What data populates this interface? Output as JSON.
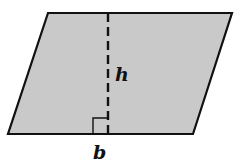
{
  "figure": {
    "shape": "parallelogram",
    "fill_color": "#c9c9c9",
    "stroke_color": "#111111",
    "vertices": {
      "top_left": [
        48,
        13
      ],
      "top_right": [
        232,
        13
      ],
      "bottom_right": [
        193,
        134
      ],
      "bottom_left": [
        8,
        134
      ]
    },
    "height_line": {
      "style": "dashed",
      "x": 108,
      "y_top": 13,
      "y_bottom": 134
    },
    "right_angle_marker": {
      "x": 93,
      "y": 118,
      "size": 15
    }
  },
  "labels": {
    "height": "h",
    "base": "b"
  }
}
